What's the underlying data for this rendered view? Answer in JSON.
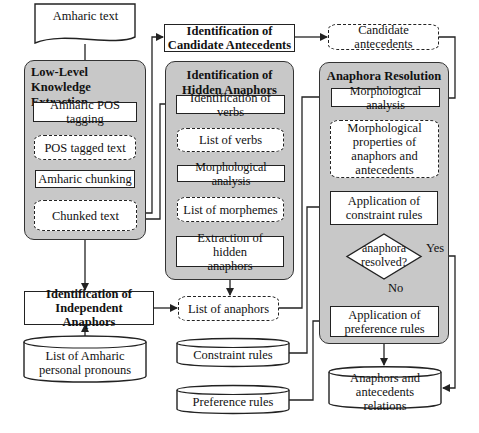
{
  "diagram": {
    "nodes": {
      "amharic_text": "Amharic text",
      "low_level_group": "Low-Level\nKnowledge\nExtraction",
      "pos_tagging": "Amharic POS tagging",
      "pos_tagged_text": "POS tagged text",
      "chunking": "Amharic chunking",
      "chunked_text": "Chunked text",
      "candidate_identification": "Identification of Candidate Antecedents",
      "candidate_antecedents": "Candidate antecedents",
      "hidden_group": "Identification of Hidden Anaphors",
      "identification_of_verbs": "Identification of verbs",
      "list_of_verbs": "List of verbs",
      "morph_analysis_hidden": "Morphological analysis",
      "list_of_morphemes": "List of morphemes",
      "extraction_hidden": "Extraction of hidden anaphors",
      "independent_identification": "Identification of Independent Anaphors",
      "pronoun_list": "List of Amharic personal pronouns",
      "list_of_anaphors": "List of anaphors",
      "constraint_rules": "Constraint rules",
      "preference_rules": "Preference rules",
      "resolution_group": "Anaphora Resolution",
      "morph_analysis_resolution": "Morphological analysis",
      "morph_properties": "Morphological properties of anaphors and antecedents",
      "apply_constraint": "Application of constraint rules",
      "decision": "anaphora resolved?",
      "apply_preference": "Application of preference rules",
      "relations": "Anaphors and antecedents relations"
    },
    "edge_labels": {
      "yes": "Yes",
      "no": "No"
    },
    "colors": {
      "group_fill": "#c8c8c8",
      "box_fill": "#ffffff",
      "stroke": "#222222"
    }
  }
}
